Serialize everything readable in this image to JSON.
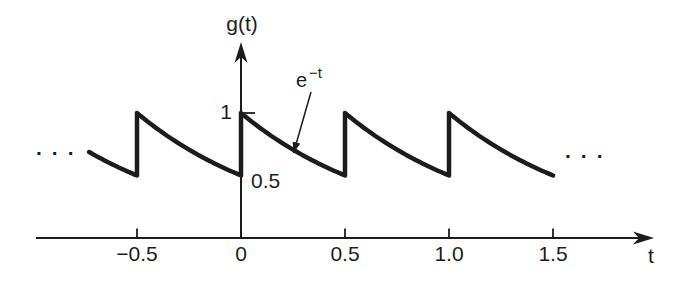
{
  "figure": {
    "background": "#ffffff",
    "ink_color": "#1c1c1c",
    "ellipsis_left": "...",
    "ellipsis_right": "...",
    "annotation": {
      "base": "e",
      "exponent": "−t"
    }
  },
  "chart_data": {
    "type": "line",
    "title": "",
    "xlabel": "t",
    "ylabel": "g(t)",
    "grid": false,
    "legend": false,
    "function": "g(t) = e^-t on each interval, periodic with period 0.5; each segment decays from 1 to 0.5 then jumps back up to 1",
    "annotation": "e^-t",
    "period": 0.5,
    "peak_value": 1,
    "trough_value": 0.5,
    "x_range_drawn": [
      -0.73,
      1.5
    ],
    "x_ticks": [
      {
        "t": -0.5,
        "label": "−0.5"
      },
      {
        "t": 0,
        "label": "0"
      },
      {
        "t": 0.5,
        "label": "0.5"
      },
      {
        "t": 1.0,
        "label": "1.0"
      },
      {
        "t": 1.5,
        "label": "1.5"
      }
    ],
    "y_ticks": [
      {
        "g": 1,
        "label": "1",
        "has_mark": true
      },
      {
        "g": 0.5,
        "label": "0.5",
        "has_mark": false
      }
    ],
    "segments": [
      {
        "from": -0.73,
        "to": -0.5,
        "period_start": -1.0,
        "partial": true
      },
      {
        "from": -0.5,
        "to": 0.0,
        "period_start": -0.5
      },
      {
        "from": 0.0,
        "to": 0.5,
        "period_start": 0.0
      },
      {
        "from": 0.5,
        "to": 1.0,
        "period_start": 0.5
      },
      {
        "from": 1.0,
        "to": 1.5,
        "period_start": 1.0
      }
    ]
  }
}
